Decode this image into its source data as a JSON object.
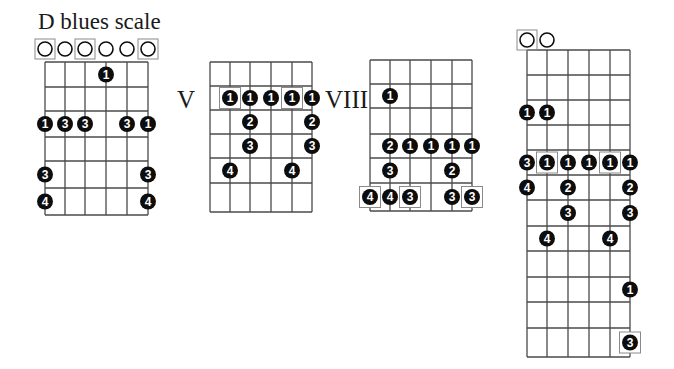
{
  "title": "D blues scale",
  "colors": {
    "line": "#4a4a4a",
    "dot": "#0d0d0d",
    "dot_text": "#ffffff",
    "box": "#8a8a8a"
  },
  "diagrams": [
    {
      "id": "diagram-open-position",
      "position_label": "",
      "strings_x": [
        45,
        65,
        85,
        106,
        127,
        148
      ],
      "frets_y": [
        62,
        87,
        111,
        137,
        161,
        188,
        215
      ],
      "open_strings": [
        {
          "string": 6,
          "boxed": true
        },
        {
          "string": 5,
          "boxed": false
        },
        {
          "string": 4,
          "boxed": true
        },
        {
          "string": 3,
          "boxed": false
        },
        {
          "string": 2,
          "boxed": false
        },
        {
          "string": 1,
          "boxed": true
        }
      ],
      "open_y": 49,
      "dots": [
        {
          "string": 3,
          "row": 1,
          "finger": "1",
          "boxed": false
        },
        {
          "string": 6,
          "row": 3,
          "finger": "1",
          "boxed": false
        },
        {
          "string": 5,
          "row": 3,
          "finger": "3",
          "boxed": false
        },
        {
          "string": 4,
          "row": 3,
          "finger": "3",
          "boxed": false
        },
        {
          "string": 2,
          "row": 3,
          "finger": "3",
          "boxed": false
        },
        {
          "string": 1,
          "row": 3,
          "finger": "1",
          "boxed": false
        },
        {
          "string": 6,
          "row": 5,
          "finger": "3",
          "boxed": false
        },
        {
          "string": 1,
          "row": 5,
          "finger": "3",
          "boxed": false
        },
        {
          "string": 6,
          "row": 6,
          "finger": "4",
          "boxed": false
        },
        {
          "string": 1,
          "row": 6,
          "finger": "4",
          "boxed": false
        }
      ]
    },
    {
      "id": "diagram-fifth-position",
      "position_label": "V",
      "label_x": 177,
      "label_y": 86,
      "strings_x": [
        210,
        230,
        250,
        271,
        292,
        312
      ],
      "frets_y": [
        62,
        86,
        110,
        134,
        158,
        183,
        212
      ],
      "open_strings": [],
      "dots": [
        {
          "string": 5,
          "row": 2,
          "finger": "1",
          "boxed": true
        },
        {
          "string": 4,
          "row": 2,
          "finger": "1",
          "boxed": false
        },
        {
          "string": 3,
          "row": 2,
          "finger": "1",
          "boxed": false
        },
        {
          "string": 2,
          "row": 2,
          "finger": "1",
          "boxed": true
        },
        {
          "string": 1,
          "row": 2,
          "finger": "1",
          "boxed": false
        },
        {
          "string": 4,
          "row": 3,
          "finger": "2",
          "boxed": false
        },
        {
          "string": 1,
          "row": 3,
          "finger": "2",
          "boxed": false
        },
        {
          "string": 4,
          "row": 4,
          "finger": "3",
          "boxed": false
        },
        {
          "string": 1,
          "row": 4,
          "finger": "3",
          "boxed": false
        },
        {
          "string": 5,
          "row": 5,
          "finger": "4",
          "boxed": false
        },
        {
          "string": 2,
          "row": 5,
          "finger": "4",
          "boxed": false
        }
      ]
    },
    {
      "id": "diagram-eighth-position",
      "position_label": "VIII",
      "label_x": 325,
      "label_y": 86,
      "strings_x": [
        370,
        390,
        410,
        431,
        452,
        472
      ],
      "frets_y": [
        60,
        84,
        108,
        134,
        158,
        183,
        211
      ],
      "open_strings": [],
      "dots": [
        {
          "string": 5,
          "row": 2,
          "finger": "1",
          "boxed": false
        },
        {
          "string": 5,
          "row": 4,
          "finger": "2",
          "boxed": false
        },
        {
          "string": 4,
          "row": 4,
          "finger": "1",
          "boxed": false
        },
        {
          "string": 3,
          "row": 4,
          "finger": "1",
          "boxed": false
        },
        {
          "string": 2,
          "row": 4,
          "finger": "1",
          "boxed": false
        },
        {
          "string": 1,
          "row": 4,
          "finger": "1",
          "boxed": false
        },
        {
          "string": 5,
          "row": 5,
          "finger": "3",
          "boxed": false
        },
        {
          "string": 2,
          "row": 5,
          "finger": "2",
          "boxed": false
        },
        {
          "string": 6,
          "row": 6,
          "finger": "4",
          "boxed": true
        },
        {
          "string": 5,
          "row": 6,
          "finger": "4",
          "boxed": false
        },
        {
          "string": 4,
          "row": 6,
          "finger": "3",
          "boxed": true
        },
        {
          "string": 2,
          "row": 6,
          "finger": "3",
          "boxed": false
        },
        {
          "string": 1,
          "row": 6,
          "finger": "3",
          "boxed": true
        }
      ]
    },
    {
      "id": "diagram-full-neck",
      "position_label": "",
      "strings_x": [
        527,
        547,
        568,
        589,
        610,
        630
      ],
      "frets_y": [
        50,
        75,
        100,
        125,
        150,
        175,
        200,
        226,
        251,
        277,
        302,
        328,
        357
      ],
      "open_strings": [
        {
          "string": 6,
          "boxed": true
        },
        {
          "string": 5,
          "boxed": false
        }
      ],
      "open_y": 40,
      "dots": [
        {
          "string": 6,
          "row": 3,
          "finger": "1",
          "boxed": false
        },
        {
          "string": 5,
          "row": 3,
          "finger": "1",
          "boxed": false
        },
        {
          "string": 6,
          "row": 5,
          "finger": "3",
          "boxed": false
        },
        {
          "string": 5,
          "row": 5,
          "finger": "1",
          "boxed": true
        },
        {
          "string": 4,
          "row": 5,
          "finger": "1",
          "boxed": false
        },
        {
          "string": 3,
          "row": 5,
          "finger": "1",
          "boxed": false
        },
        {
          "string": 2,
          "row": 5,
          "finger": "1",
          "boxed": true
        },
        {
          "string": 1,
          "row": 5,
          "finger": "1",
          "boxed": false
        },
        {
          "string": 6,
          "row": 6,
          "finger": "4",
          "boxed": false
        },
        {
          "string": 4,
          "row": 6,
          "finger": "2",
          "boxed": false
        },
        {
          "string": 1,
          "row": 6,
          "finger": "2",
          "boxed": false
        },
        {
          "string": 4,
          "row": 7,
          "finger": "3",
          "boxed": false
        },
        {
          "string": 1,
          "row": 7,
          "finger": "3",
          "boxed": false
        },
        {
          "string": 5,
          "row": 8,
          "finger": "4",
          "boxed": false
        },
        {
          "string": 2,
          "row": 8,
          "finger": "4",
          "boxed": false
        },
        {
          "string": 1,
          "row": 10,
          "finger": "1",
          "boxed": false
        },
        {
          "string": 1,
          "row": 12,
          "finger": "3",
          "boxed": true
        }
      ]
    }
  ]
}
